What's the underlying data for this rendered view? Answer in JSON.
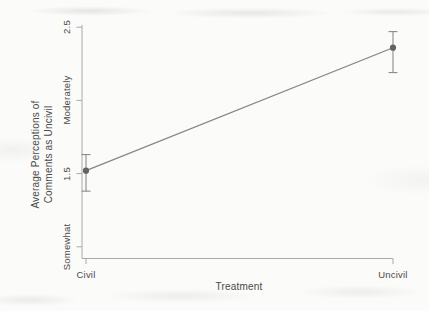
{
  "chart_data": {
    "type": "line",
    "title": "",
    "xlabel": "Treatment",
    "ylabel_lines": [
      "Average Perceptions of",
      "Comments as Uncivil"
    ],
    "categories": [
      "Civil",
      "Uncivil"
    ],
    "series": [
      {
        "name": "Average perception of comments as uncivil",
        "values": [
          1.52,
          2.36
        ],
        "ci_low": [
          1.38,
          2.19
        ],
        "ci_high": [
          1.63,
          2.47
        ]
      }
    ],
    "yticks": [
      {
        "value": 1.0,
        "label": "Somewhat"
      },
      {
        "value": 1.5,
        "label": "1.5"
      },
      {
        "value": 2.0,
        "label": "Moderately"
      },
      {
        "value": 2.5,
        "label": "2.5"
      }
    ],
    "ylim": [
      0.92,
      2.515
    ],
    "grid": false,
    "legend": "none",
    "colors": {
      "background": "#fbfbf9",
      "axis": "#a9a9a6",
      "text": "#4a4a4a",
      "line": "#858585",
      "marker": "#636363",
      "error_bar": "#8b8b8b"
    }
  }
}
